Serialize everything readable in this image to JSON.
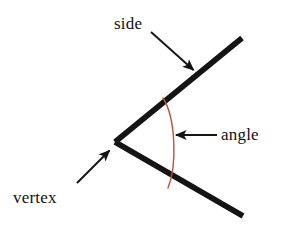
{
  "figure": {
    "type": "geometry-diagram",
    "subject": "angle",
    "background_color": "#ffffff",
    "labels": {
      "side": "side",
      "angle": "angle",
      "vertex": "vertex"
    },
    "colors": {
      "ray": "#141414",
      "arc": "#c0503a",
      "leader": "#141414",
      "text": "#111111"
    },
    "geometry": {
      "vertex_point": [
        115,
        142
      ],
      "upper_ray_end": [
        242,
        38
      ],
      "lower_ray_end": [
        243,
        216
      ],
      "ray_width": 5.6,
      "arc_start": [
        163,
        98
      ],
      "arc_end": [
        168,
        188
      ],
      "arc_width": 1.4
    },
    "leaders": [
      {
        "name": "side-leader",
        "from": [
          151,
          32
        ],
        "to": [
          196,
          72
        ]
      },
      {
        "name": "angle-leader",
        "from": [
          217,
          135
        ],
        "to": [
          173,
          135
        ]
      },
      {
        "name": "vertex-leader",
        "from": [
          77,
          183
        ],
        "to": [
          112,
          148
        ]
      }
    ]
  }
}
